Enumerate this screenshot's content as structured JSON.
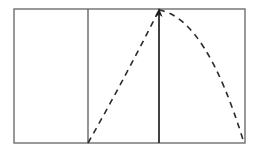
{
  "figure": {
    "type": "line-diagram",
    "canvas": {
      "width": 258,
      "height": 154,
      "background": "#ffffff"
    },
    "colors": {
      "frame_stroke": "#6e6e6e",
      "divider_stroke": "#5a5a5a",
      "trajectory_stroke": "#2b2b2b",
      "arrow_stroke": "#1e1e1e",
      "background": "#ffffff"
    },
    "frame": {
      "label": "outer-rectangle",
      "x": 14,
      "y": 9,
      "width": 231,
      "height": 134,
      "stroke_width": 1.4
    },
    "dividers": [
      {
        "label": "divider-left",
        "x": 88,
        "y_top": 9,
        "y_bottom": 143,
        "stroke_width": 1.3
      },
      {
        "label": "divider-right",
        "x": 159,
        "y_top": 9,
        "y_bottom": 143,
        "stroke_width": 1.3
      }
    ],
    "trajectory": {
      "label": "dashed-parabolic-path",
      "dash_pattern": "6 5",
      "stroke_width": 1.6,
      "start": {
        "x": 88,
        "y": 143
      },
      "apex": {
        "x": 159,
        "y": 10
      },
      "end": {
        "x": 244,
        "y": 143
      },
      "ascending_control": {
        "x": 126,
        "y": 76
      },
      "descending_control": {
        "x": 206,
        "y": 18
      }
    },
    "arrow": {
      "label": "vertical-up-arrow",
      "x": 159,
      "tail_y": 143,
      "head_y": 9,
      "head_width": 7,
      "head_length": 8,
      "stroke_width": 1.4,
      "direction": "up"
    },
    "panels": [
      {
        "label": "panel-left",
        "x_start": 14,
        "x_end": 88,
        "content": ""
      },
      {
        "label": "panel-middle",
        "x_start": 88,
        "x_end": 159,
        "content": ""
      },
      {
        "label": "panel-right",
        "x_start": 159,
        "x_end": 245,
        "content": ""
      }
    ]
  },
  "chart_data": {
    "type": "line",
    "xlabel": "",
    "ylabel": "",
    "grid": false,
    "legend": "none",
    "xlim": [
      14,
      245
    ],
    "ylim": [
      9,
      143
    ],
    "series": [
      {
        "name": "dashed-parabolic-path",
        "style": "dashed",
        "x": [
          88,
          103,
          117,
          131,
          145,
          159,
          174,
          189,
          203,
          217,
          231,
          244
        ],
        "y": [
          143,
          117,
          93,
          69,
          41,
          10,
          22,
          41,
          61,
          85,
          113,
          143
        ]
      },
      {
        "name": "vertical-arrow",
        "style": "solid-arrow-up",
        "x": [
          159,
          159
        ],
        "y": [
          143,
          9
        ]
      }
    ],
    "annotations": [
      {
        "name": "divider-left",
        "type": "vline",
        "x": 88
      },
      {
        "name": "divider-right",
        "type": "vline",
        "x": 159
      }
    ]
  }
}
